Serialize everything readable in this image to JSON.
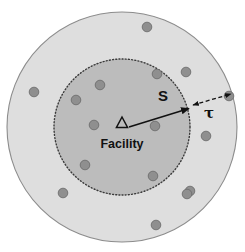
{
  "figure": {
    "background_color": "#ffffff"
  },
  "labels": {
    "facility": "Facility",
    "service_radius": "S",
    "buffer_band": "τ"
  },
  "icons": {
    "facility_marker": "triangle-outline-icon",
    "service_radius_arrow": "arrow-right-icon",
    "buffer_arrow": "double-headed-dashed-arrow-icon"
  },
  "colors": {
    "outer_ring_fill": "#dedede",
    "inner_disc_fill": "#bcbcbc",
    "outer_ring_stroke": "#8c8c8c",
    "inner_disc_stroke": "#3a3a3a",
    "demand_point_fill": "#8f8f8f",
    "demand_point_stroke": "#6e6e6e",
    "annotation_stroke": "#111111",
    "label_color": "#111111"
  },
  "geometry": {
    "center": {
      "x": 122,
      "y": 127
    },
    "outer_radius": 115,
    "inner_radius": 68,
    "demand_point_radius": 4.8,
    "inner_circle_style": "dotted",
    "outer_circle_style": "solid"
  },
  "annotations": {
    "s_arrow": {
      "x1": 128,
      "y1": 127,
      "x2": 190,
      "y2": 108,
      "style": "solid",
      "arrowheads": "end",
      "label": "S",
      "label_x": 163,
      "label_y": 100
    },
    "tau_arrow": {
      "x1": 192,
      "y1": 105,
      "x2": 230,
      "y2": 94,
      "style": "dashed",
      "arrowheads": "both",
      "label": "τ",
      "label_x": 208,
      "label_y": 117
    },
    "facility_marker": {
      "x": 122,
      "y": 126,
      "size": 9,
      "label": "Facility",
      "label_x": 122,
      "label_y": 148
    }
  },
  "demand_points": [
    {
      "id": 1,
      "x": 147,
      "y": 27,
      "zone": "outer-ring"
    },
    {
      "id": 2,
      "x": 229,
      "y": 96,
      "zone": "outer-ring"
    },
    {
      "id": 3,
      "x": 34,
      "y": 92,
      "zone": "outer-ring"
    },
    {
      "id": 4,
      "x": 206,
      "y": 136,
      "zone": "outer-ring"
    },
    {
      "id": 5,
      "x": 63,
      "y": 193,
      "zone": "outer-ring"
    },
    {
      "id": 6,
      "x": 190,
      "y": 191,
      "zone": "outer-ring"
    },
    {
      "id": 7,
      "x": 156,
      "y": 225,
      "zone": "outer-ring"
    },
    {
      "id": 8,
      "x": 157,
      "y": 74,
      "zone": "inner-disc"
    },
    {
      "id": 9,
      "x": 186,
      "y": 72,
      "zone": "inner-disc"
    },
    {
      "id": 10,
      "x": 100,
      "y": 85,
      "zone": "inner-disc"
    },
    {
      "id": 11,
      "x": 76,
      "y": 100,
      "zone": "inner-disc"
    },
    {
      "id": 12,
      "x": 94,
      "y": 125,
      "zone": "inner-disc"
    },
    {
      "id": 13,
      "x": 85,
      "y": 165,
      "zone": "inner-disc"
    },
    {
      "id": 14,
      "x": 153,
      "y": 176,
      "zone": "inner-disc"
    },
    {
      "id": 15,
      "x": 155,
      "y": 126,
      "zone": "inner-disc"
    },
    {
      "id": 16,
      "x": 187,
      "y": 194,
      "zone": "outer-ring"
    }
  ]
}
